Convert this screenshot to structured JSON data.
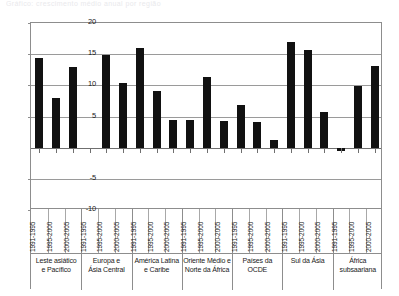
{
  "caption": {
    "ghost_text": "Gráfico: crescimento médio anual por região"
  },
  "chart_data": {
    "type": "bar",
    "title": "",
    "xlabel": "",
    "ylabel": "",
    "ylim": [
      -10,
      20
    ],
    "yticks": [
      20,
      15,
      10,
      5,
      0,
      -5,
      -10
    ],
    "ytick_labels": [
      "20",
      "15",
      "10",
      "5",
      "",
      "-5",
      "-10"
    ],
    "grid": true,
    "legend": "none",
    "categories": [
      "1991-1995",
      "1995-2000",
      "2000-2005"
    ],
    "groups": [
      {
        "name": "Leste asiático e Pacífico",
        "line1": "Leste asiático",
        "line2": "e Pacífico",
        "values": [
          14.4,
          7.9,
          13.0
        ]
      },
      {
        "name": "Europa e Ásia Central",
        "line1": "Europa e",
        "line2": "Ásia Central",
        "values": [
          0.0,
          14.9,
          10.3
        ]
      },
      {
        "name": "América Latina e Caribe",
        "line1": "América Latina",
        "line2": "e Caribe",
        "values": [
          16.0,
          9.1,
          4.5
        ]
      },
      {
        "name": "Oriente Médio e Norte da África",
        "line1": "Oriente Médio e",
        "line2": "Norte da África",
        "values": [
          4.5,
          11.4,
          4.2
        ]
      },
      {
        "name": "Países da OCDE",
        "line1": "Países da OCDE",
        "line2": "",
        "values": [
          6.9,
          4.1,
          1.3
        ]
      },
      {
        "name": "Sul da Ásia",
        "line1": "Sul da Ásia",
        "line2": "",
        "values": [
          17.0,
          15.7,
          5.7
        ]
      },
      {
        "name": "África subsaariana",
        "line1": "África",
        "line2": "subsaariana",
        "values": [
          -0.6,
          9.9,
          13.1
        ]
      }
    ]
  }
}
